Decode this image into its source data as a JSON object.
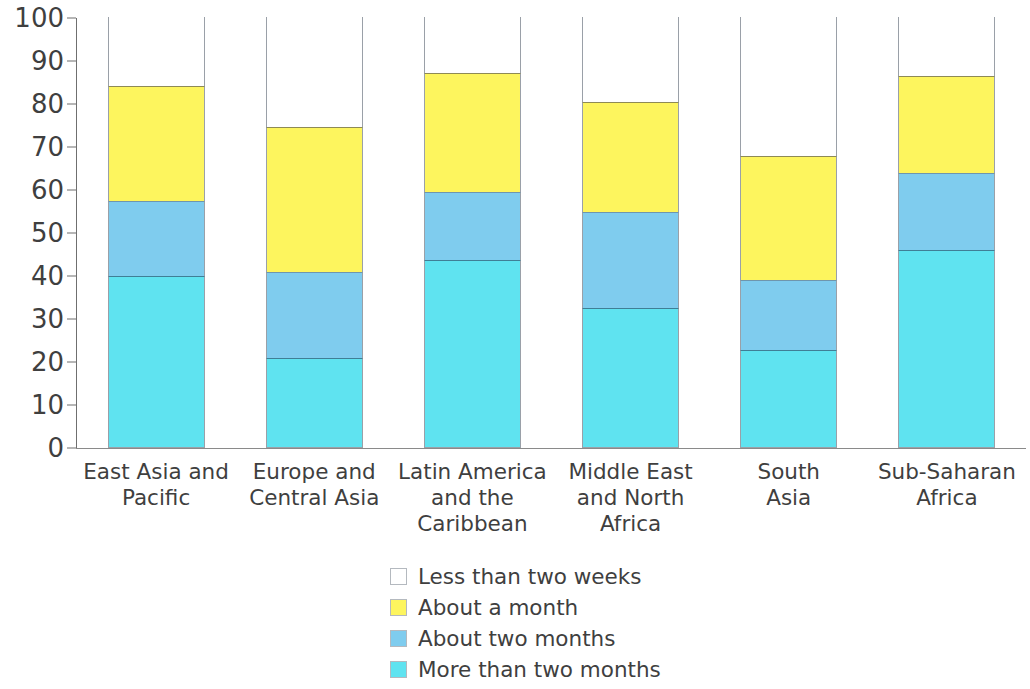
{
  "chart_data": {
    "type": "bar",
    "subtype": "stacked-bar-100-percent",
    "title": "",
    "subtitle": "",
    "xlabel": "",
    "ylabel": "",
    "ylim": [
      0,
      100
    ],
    "yticks": [
      0,
      10,
      20,
      30,
      40,
      50,
      60,
      70,
      80,
      90,
      100
    ],
    "ytick_labels": [
      "0",
      "10",
      "20",
      "30",
      "40",
      "50",
      "60",
      "70",
      "80",
      "90",
      "100"
    ],
    "grid": false,
    "legend_position": "bottom-center",
    "categories": [
      "East Asia and Pacific",
      "Europe and Central Asia",
      "Latin America and the Caribbean",
      "Middle East and North Africa",
      "South Asia",
      "Sub-Saharan Africa"
    ],
    "category_lines": [
      [
        "East Asia and",
        "Pacific"
      ],
      [
        "Europe and",
        "Central Asia"
      ],
      [
        "Latin America",
        "and the",
        "Caribbean"
      ],
      [
        "Middle East",
        "and North",
        "Africa"
      ],
      [
        "South",
        "Asia"
      ],
      [
        "Sub-Saharan",
        "Africa"
      ]
    ],
    "series": [
      {
        "name": "More than two months",
        "color": "#5FE3F0",
        "values": [
          39.8,
          20.8,
          43.5,
          32.4,
          22.6,
          45.9
        ]
      },
      {
        "name": "About two months",
        "color": "#7FCCEE",
        "values": [
          17.4,
          19.8,
          15.9,
          22.2,
          16.3,
          17.9
        ]
      },
      {
        "name": "About a month",
        "color": "#FDF55E",
        "values": [
          26.8,
          33.8,
          27.5,
          25.7,
          28.8,
          22.5
        ]
      },
      {
        "name": "Less than two weeks",
        "color": "#FFFFFF",
        "values": [
          16.0,
          25.6,
          13.1,
          19.7,
          32.3,
          13.7
        ]
      }
    ],
    "cumulative_tops": [
      {
        "more_than_two_months": 39.8,
        "about_two_months": 57.2,
        "about_a_month": 84.0,
        "less_than_two_weeks": 100
      },
      {
        "more_than_two_months": 20.8,
        "about_two_months": 40.6,
        "about_a_month": 74.4,
        "less_than_two_weeks": 100
      },
      {
        "more_than_two_months": 43.5,
        "about_two_months": 59.4,
        "about_a_month": 86.9,
        "less_than_two_weeks": 100
      },
      {
        "more_than_two_months": 32.4,
        "about_two_months": 54.6,
        "about_a_month": 80.3,
        "less_than_two_weeks": 100
      },
      {
        "more_than_two_months": 22.6,
        "about_two_months": 38.9,
        "about_a_month": 67.7,
        "less_than_two_weeks": 100
      },
      {
        "more_than_two_months": 45.9,
        "about_two_months": 63.8,
        "about_a_month": 86.3,
        "less_than_two_weeks": 100
      }
    ]
  },
  "legend": {
    "items": [
      {
        "label": "Less than two weeks",
        "color": "#FFFFFF"
      },
      {
        "label": "About a month",
        "color": "#FDF55E"
      },
      {
        "label": "About two months",
        "color": "#7FCCEE"
      },
      {
        "label": "More than two months",
        "color": "#5FE3F0"
      }
    ]
  },
  "colors": {
    "axis": "#6F6F6F",
    "text": "#3F3F3F",
    "bar_outline": "#9AA0A8",
    "background": "#FFFFFF"
  }
}
